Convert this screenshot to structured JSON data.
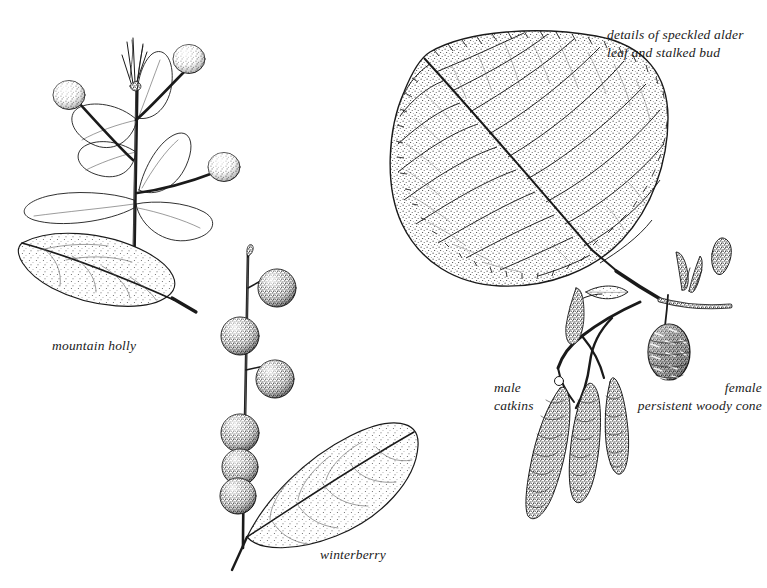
{
  "plate": {
    "title": "speckled alder, mountain holly and winterberry botanical plate",
    "background_color": "#ffffff",
    "ink_color": "#1a1a1a",
    "width": 767,
    "height": 588
  },
  "captions": {
    "alder_detail_line1": "details of speckled alder",
    "alder_detail_line2": "leaf and stalked bud",
    "mountain_holly": "mountain holly",
    "winterberry": "winterberry",
    "male_line1": "male",
    "male_line2": "catkins",
    "female_line1": "female",
    "female_line2": "persistent woody cone"
  },
  "figures": [
    {
      "name": "mountain-holly-branch",
      "label": "mountain holly",
      "parts": [
        "upright stem",
        "terminal bud cluster",
        "outline leaves",
        "three stippled berries on long pedicels",
        "detached stippled leaf"
      ],
      "berry_count": 3
    },
    {
      "name": "winterberry-twig",
      "label": "winterberry",
      "parts": [
        "upright twig",
        "six dark stippled berries",
        "elliptic stippled leaf"
      ],
      "berry_count": 6
    },
    {
      "name": "speckled-alder-leaf",
      "label": "details of speckled alder leaf and stalked bud",
      "parts": [
        "large ovate stippled leaf",
        "pinnate veins",
        "doubly serrate margin",
        "petiole",
        "twig with stalked buds",
        "detached bud"
      ]
    },
    {
      "name": "alder-male-catkins",
      "label": "male catkins",
      "parts": [
        "twig",
        "small leaf",
        "three pendulous scaly catkins"
      ],
      "catkin_count": 3
    },
    {
      "name": "alder-female-cone",
      "label": "female persistent woody cone",
      "parts": [
        "stalked ovoid woody cone"
      ],
      "cone_count": 1
    }
  ]
}
